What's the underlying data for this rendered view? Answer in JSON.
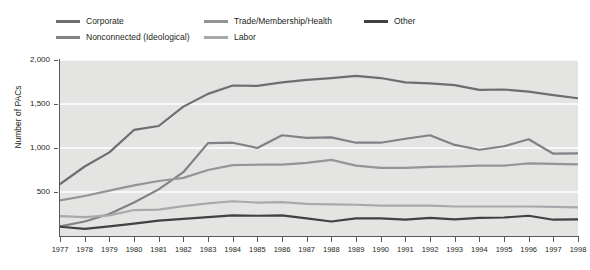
{
  "chart_data": {
    "type": "line",
    "title": "",
    "xlabel": "",
    "ylabel": "Number of PACs",
    "xlim": [
      1977,
      1998
    ],
    "ylim": [
      0,
      2000
    ],
    "yticks": [
      0,
      500,
      1000,
      1500,
      2000
    ],
    "ytick_labels": [
      "0",
      "500",
      "1,000",
      "1,500",
      "2,000"
    ],
    "grid": "horizontal-white",
    "legend_position": "top-outside",
    "x": [
      1977,
      1978,
      1979,
      1980,
      1981,
      1982,
      1983,
      1984,
      1985,
      1986,
      1987,
      1988,
      1989,
      1990,
      1991,
      1992,
      1993,
      1994,
      1995,
      1996,
      1997,
      1998
    ],
    "series": [
      {
        "name": "Corporate",
        "color": "#6d6e71",
        "values": [
          590,
          790,
          950,
          1205,
          1250,
          1470,
          1615,
          1710,
          1705,
          1745,
          1775,
          1795,
          1820,
          1795,
          1745,
          1735,
          1715,
          1660,
          1665,
          1640,
          1600,
          1565
        ]
      },
      {
        "name": "Nonconnected (Ideological)",
        "color": "#808285",
        "values": [
          110,
          165,
          250,
          380,
          530,
          725,
          1055,
          1060,
          1000,
          1145,
          1115,
          1120,
          1060,
          1060,
          1105,
          1145,
          1035,
          980,
          1020,
          1100,
          935,
          940
        ]
      },
      {
        "name": "Trade/Membership/Health",
        "color": "#939598",
        "values": [
          405,
          455,
          515,
          575,
          625,
          660,
          750,
          805,
          810,
          810,
          830,
          865,
          800,
          775,
          775,
          785,
          790,
          800,
          800,
          825,
          820,
          815
        ]
      },
      {
        "name": "Labor",
        "color": "#a7a9ac",
        "values": [
          225,
          215,
          235,
          295,
          300,
          340,
          370,
          395,
          380,
          385,
          365,
          360,
          355,
          345,
          345,
          345,
          335,
          335,
          335,
          335,
          330,
          325
        ]
      },
      {
        "name": "Other",
        "color": "#414042",
        "values": [
          105,
          80,
          110,
          140,
          175,
          195,
          215,
          235,
          230,
          235,
          200,
          165,
          200,
          200,
          185,
          205,
          190,
          205,
          210,
          230,
          185,
          190
        ]
      }
    ]
  },
  "legend": {
    "items": [
      {
        "label": "Corporate",
        "color": "#6d6e71"
      },
      {
        "label": "Nonconnected (Ideological)",
        "color": "#808285"
      },
      {
        "label": "Trade/Membership/Health",
        "color": "#939598"
      },
      {
        "label": "Labor",
        "color": "#a7a9ac"
      },
      {
        "label": "Other",
        "color": "#414042"
      }
    ]
  },
  "axes": {
    "y_title": "Number of PACs",
    "y_ticks": [
      "2,000",
      "1,500",
      "1,000",
      "500"
    ],
    "x_ticks": [
      "1977",
      "1978",
      "1979",
      "1980",
      "1981",
      "1982",
      "1983",
      "1984",
      "1985",
      "1986",
      "1987",
      "1988",
      "1989",
      "1990",
      "1991",
      "1992",
      "1993",
      "1994",
      "1995",
      "1996",
      "1997",
      "1998"
    ]
  },
  "colors": {
    "plot_background": "#e4e4e2",
    "gridline": "#ffffff",
    "axis": "#58595b",
    "text": "#231f20"
  }
}
